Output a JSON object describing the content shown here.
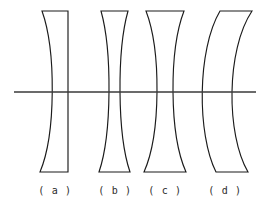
{
  "figure": {
    "type": "optics-diagram",
    "background_color": "#ffffff",
    "stroke_color": "#1b1b1b",
    "axis_color": "#3a3a3a",
    "width": 261,
    "height": 212
  },
  "optical_axis": {
    "label": "optical-axis",
    "x_start": 14,
    "x_end": 256,
    "y": 92
  },
  "lenses": [
    {
      "id": "a",
      "caption": "( a )",
      "lens_form": "plano-concave",
      "left_surface": "concave",
      "right_surface": "plano",
      "top_y": 11,
      "bottom_y": 172,
      "top_left_x": 42,
      "top_right_x": 68,
      "bottom_left_x": 40,
      "bottom_right_x": 68,
      "waist_left_x": 54,
      "waist_right_x": 68,
      "center_thickness": 14,
      "path": "M 42 11 L 68 11 L 68 172 L 40 172 C 56 134 56 50 42 11 Z"
    },
    {
      "id": "b",
      "caption": "( b )",
      "lens_form": "biconcave",
      "left_surface": "concave",
      "right_surface": "concave",
      "top_y": 11,
      "bottom_y": 172,
      "top_left_x": 101,
      "top_right_x": 128,
      "bottom_left_x": 99,
      "bottom_right_x": 130,
      "waist_left_x": 110,
      "waist_right_x": 119,
      "center_thickness": 9,
      "path": "M 101 11 L 128 11 C 117 50 117 134 130 172 L 99 172 C 112 134 112 50 101 11 Z"
    },
    {
      "id": "c",
      "caption": "( c )",
      "lens_form": "biconcave",
      "left_surface": "concave",
      "right_surface": "concave",
      "top_y": 11,
      "bottom_y": 172,
      "top_left_x": 146,
      "top_right_x": 184,
      "bottom_left_x": 144,
      "bottom_right_x": 186,
      "waist_left_x": 158,
      "waist_right_x": 172,
      "center_thickness": 14,
      "path": "M 146 11 L 184 11 C 169 50 169 134 186 172 L 144 172 C 161 134 161 50 146 11 Z"
    },
    {
      "id": "d",
      "caption": "( d )",
      "lens_form": "concavo-convex meniscus",
      "left_surface": "convex",
      "right_surface": "concave",
      "top_y": 11,
      "bottom_y": 172,
      "top_left_x": 220,
      "top_right_x": 252,
      "bottom_left_x": 216,
      "bottom_right_x": 248,
      "waist_left_x": 210,
      "waist_right_x": 223,
      "center_thickness": 13,
      "path": "M 220 11 L 252 11 C 226 50 226 134 248 172 L 216 172 C 197 134 197 50 220 11 Z"
    }
  ],
  "captions": {
    "a": "( a )",
    "b": "( b )",
    "c": "( c )",
    "d": "( d )"
  }
}
